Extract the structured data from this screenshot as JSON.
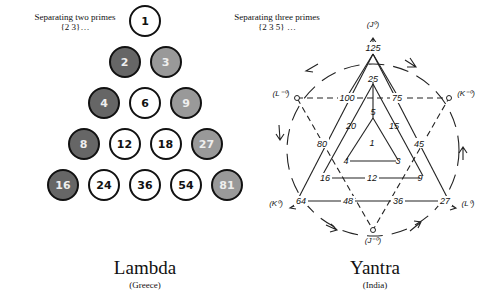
{
  "lambda": {
    "caption_line1": "Separating two primes",
    "caption_line2": "{2 3}…",
    "title": "Lambda",
    "subtitle": "(Greece)",
    "colors": {
      "white": "#ffffff",
      "dark": "#666666",
      "light": "#999999"
    },
    "rows": [
      [
        {
          "v": "1",
          "t": "white"
        }
      ],
      [
        {
          "v": "2",
          "t": "dark"
        },
        {
          "v": "3",
          "t": "light"
        }
      ],
      [
        {
          "v": "4",
          "t": "dark"
        },
        {
          "v": "6",
          "t": "white"
        },
        {
          "v": "9",
          "t": "light"
        }
      ],
      [
        {
          "v": "8",
          "t": "dark"
        },
        {
          "v": "12",
          "t": "white"
        },
        {
          "v": "18",
          "t": "white"
        },
        {
          "v": "27",
          "t": "light"
        }
      ],
      [
        {
          "v": "16",
          "t": "dark"
        },
        {
          "v": "24",
          "t": "white"
        },
        {
          "v": "36",
          "t": "white"
        },
        {
          "v": "54",
          "t": "white"
        },
        {
          "v": "81",
          "t": "light"
        }
      ]
    ]
  },
  "yantra": {
    "caption_line1": "Separating three primes",
    "caption_line2": "{2 3 5} …",
    "title": "Yantra",
    "subtitle": "(India)",
    "labels": {
      "n125": "125",
      "n25": "25",
      "n5": "5",
      "n1": "1",
      "n100": "100",
      "n75": "75",
      "n20": "20",
      "n15": "15",
      "n80": "80",
      "n45": "45",
      "n4": "4",
      "n3": "3",
      "n16": "16",
      "n12": "12",
      "n9": "9",
      "n64": "64",
      "n48": "48",
      "n36": "36",
      "n27": "27",
      "j_pos": "(J⁰)",
      "l_neg": "(L⁻⁰)",
      "k_neg": "(K⁻⁰)",
      "k_pos": "(K⁰)",
      "l_pos": "(L⁰)",
      "j_neg": "(J⁻⁰)"
    }
  }
}
